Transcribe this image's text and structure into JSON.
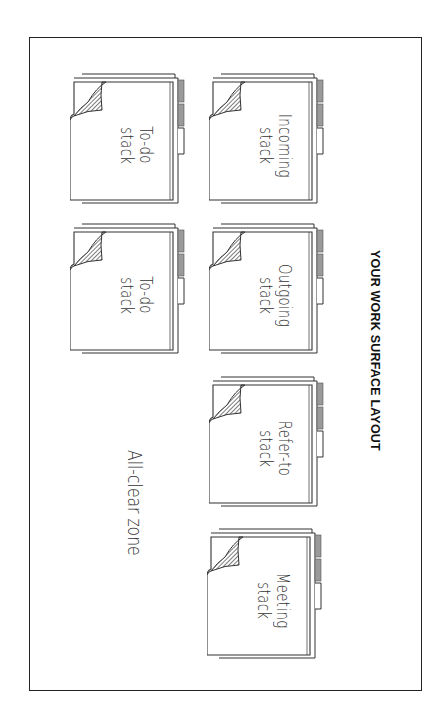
{
  "title": "YOUR WORK SURFACE LAYOUT",
  "zone_label": "All-clear zone",
  "colors": {
    "line": "#222222",
    "tab_fill": "#9a9a9a",
    "hatch": "#333333",
    "background": "#ffffff"
  },
  "folders": [
    {
      "line1": "To-do",
      "line2": "stack",
      "x": 70,
      "y": 72
    },
    {
      "line1": "Incoming",
      "line2": "stack",
      "x": 209,
      "y": 72
    },
    {
      "line1": "To-do",
      "line2": "stack",
      "x": 70,
      "y": 222
    },
    {
      "line1": "Outgoing",
      "line2": "stack",
      "x": 209,
      "y": 222
    },
    {
      "line1": "Refer-to",
      "line2": "stack",
      "x": 209,
      "y": 375
    },
    {
      "line1": "Meeting",
      "line2": "stack",
      "x": 207,
      "y": 527
    }
  ]
}
